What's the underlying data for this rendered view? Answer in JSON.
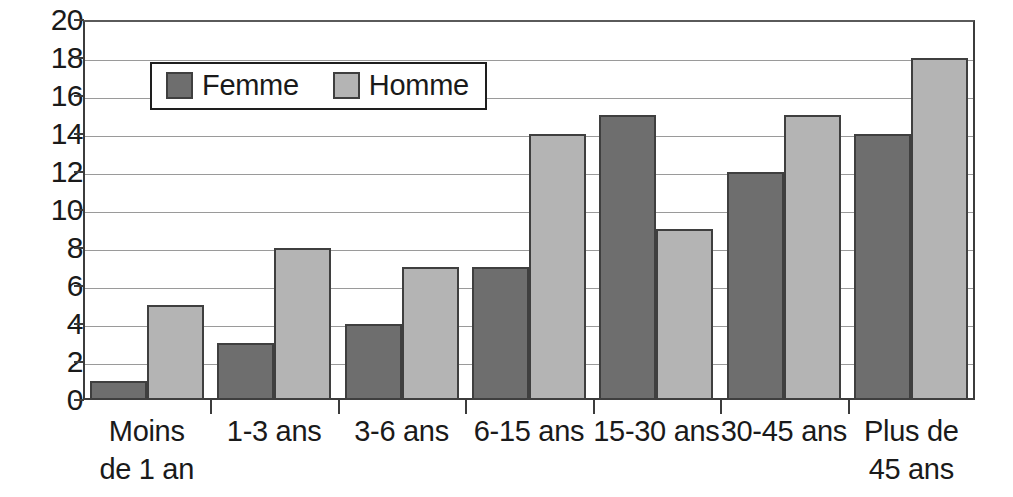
{
  "chart_data": {
    "type": "bar",
    "title": "",
    "subtitle": "",
    "xlabel": "",
    "ylabel": "",
    "categories": [
      "Moins\nde 1 an",
      "1-3 ans",
      "3-6 ans",
      "6-15 ans",
      "15-30 ans",
      "30-45 ans",
      "Plus de\n45 ans"
    ],
    "series": [
      {
        "name": "Femme",
        "color": "#6e6e6e",
        "values": [
          1,
          3,
          4,
          7,
          15,
          12,
          14
        ]
      },
      {
        "name": "Homme",
        "color": "#b4b4b4",
        "values": [
          5,
          8,
          7,
          14,
          9,
          15,
          18
        ]
      }
    ],
    "ylim": [
      0,
      20
    ],
    "ytick_step": 2,
    "yticks": [
      0,
      2,
      4,
      6,
      8,
      10,
      12,
      14,
      16,
      18,
      20
    ],
    "ytick_labels": [
      "0",
      "2",
      "4",
      "6",
      "8",
      "10",
      "12",
      "14",
      "16",
      "18",
      "20"
    ],
    "grid": true,
    "grid_axis": "y",
    "legend_position": "upper-left",
    "legend_boxed": true
  },
  "legend": {
    "items": [
      {
        "label": "Femme",
        "swatch": "femme"
      },
      {
        "label": "Homme",
        "swatch": "homme"
      }
    ]
  },
  "axis": {
    "y_labels": [
      "20",
      "18",
      "16",
      "14",
      "12",
      "10",
      "8",
      "6",
      "4",
      "2",
      "0"
    ],
    "x_labels": [
      {
        "line1": "Moins",
        "line2": "de 1 an"
      },
      {
        "line1": "1-3 ans",
        "line2": ""
      },
      {
        "line1": "3-6 ans",
        "line2": ""
      },
      {
        "line1": "6-15 ans",
        "line2": ""
      },
      {
        "line1": "15-30 ans",
        "line2": ""
      },
      {
        "line1": "30-45 ans",
        "line2": ""
      },
      {
        "line1": "Plus de",
        "line2": "45 ans"
      }
    ]
  },
  "colors": {
    "femme": "#6e6e6e",
    "homme": "#b4b4b4",
    "grid": "#9a9a9a",
    "axis": "#3c3c3c",
    "background": "#ffffff",
    "text": "#1a1a1a"
  }
}
